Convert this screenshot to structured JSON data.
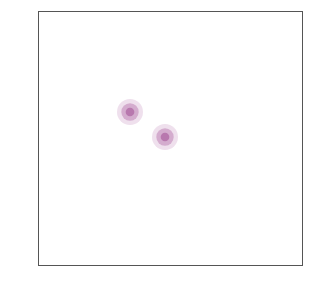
{
  "canvas": {
    "width": 322,
    "height": 283,
    "background": "#ffffff"
  },
  "frame": {
    "x": 38,
    "y": 11,
    "width": 265,
    "height": 255,
    "stroke_color": "#555555",
    "stroke_width": 1.2,
    "fill": "none"
  },
  "chart_data": {
    "type": "line",
    "title": "",
    "subtitle": "",
    "xlabel": "",
    "ylabel": "",
    "grid": false,
    "legend": null,
    "axis_visible": false,
    "tick_labels": [],
    "annotations": [],
    "render": {
      "curve_count": 44,
      "points_per_curve": 70,
      "stroke_color": "#8E3A7E",
      "stroke_color_light": "#B druck",
      "stroke_width_inner": 1.05,
      "stroke_width_outer": 0.85,
      "opacity_inner": 0.95,
      "opacity_outer": 0.62,
      "rotation_offset_deg": 0
    },
    "nodes": [
      {
        "name": "vortex-node-upper-left",
        "cx": 130,
        "cy": 112,
        "radius": 13
      },
      {
        "name": "vortex-node-lower-right",
        "cx": 165,
        "cy": 137,
        "radius": 13
      }
    ],
    "spiral": {
      "center_x": 147.5,
      "center_y": 124.5,
      "node_separation": 43.0,
      "node_angle_deg": 35.0,
      "r_start": 4.0,
      "r_end": 150.0,
      "turn_total_deg": 118.0,
      "growth_exponent": 1.35,
      "sweep_direction": "counter-clockwise",
      "arc_span_deg": 360.0
    },
    "colors": {
      "arc": "#8E3A7E",
      "arc_core": "#9B3F8C",
      "arc_fade": "#C09BBC",
      "frame": "#555555",
      "background": "#ffffff"
    }
  }
}
